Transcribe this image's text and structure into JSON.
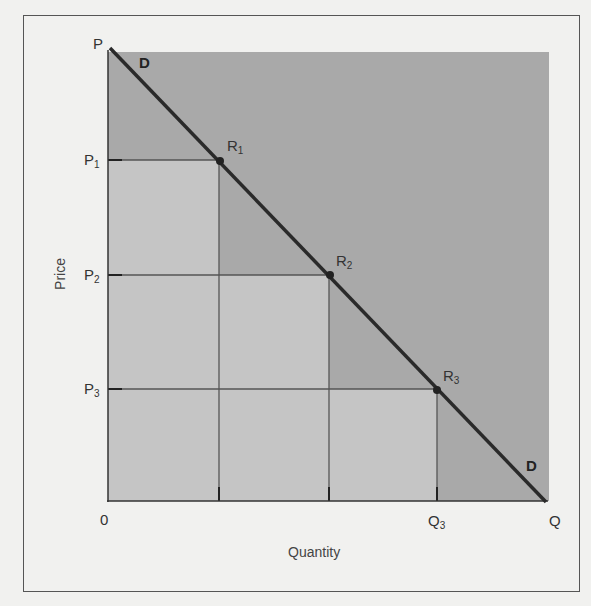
{
  "diagram": {
    "type": "demand-curve-consumer-surplus-staircase",
    "axes": {
      "x_title": "Quantity",
      "y_title": "Price",
      "origin_label": "0",
      "x_end_label": "Q",
      "y_end_label": "P"
    },
    "curve": {
      "label_top": "D",
      "label_bottom": "D"
    },
    "price_levels": [
      {
        "base": "P",
        "sub": "1"
      },
      {
        "base": "P",
        "sub": "2"
      },
      {
        "base": "P",
        "sub": "3"
      }
    ],
    "quantity_labels": [
      {
        "base": "Q",
        "sub": "3"
      }
    ],
    "points": [
      {
        "base": "R",
        "sub": "1"
      },
      {
        "base": "R",
        "sub": "2"
      },
      {
        "base": "R",
        "sub": "3"
      }
    ],
    "colors": {
      "background": "#f1f1ef",
      "dark_region": "#a9a9a9",
      "light_region": "#c5c5c5",
      "line": "#2a2a2a",
      "grid_line": "#555555"
    }
  }
}
